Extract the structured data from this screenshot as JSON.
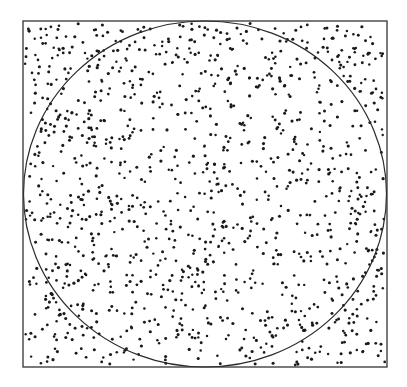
{
  "figure": {
    "kind": "monte-carlo-pi-estimation",
    "description": "Random points uniformly scattered in a square with an inscribed circle",
    "canvas": {
      "width": 407,
      "height": 387,
      "background": "#ffffff"
    },
    "square": {
      "x": 23,
      "y": 21,
      "width": 364,
      "height": 346,
      "stroke": "#333333",
      "stroke_width": 1.3
    },
    "circle": {
      "cx": 205,
      "cy": 194,
      "rx": 181.5,
      "ry": 173,
      "stroke": "#2a2a2a",
      "stroke_width": 1.2
    },
    "points": {
      "count": 1250,
      "radius": 1.4,
      "color": "#1a1a1a",
      "seed": 20240611
    }
  }
}
